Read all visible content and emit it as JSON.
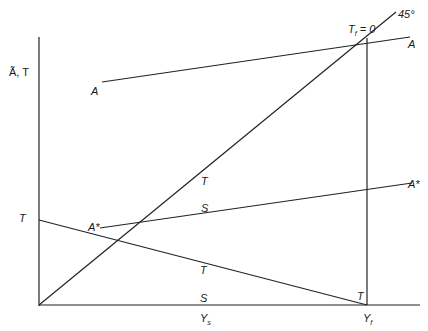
{
  "diagram": {
    "y_axis_label": "Ã,  T",
    "x_axis_tick_labels": [
      {
        "main": "Y",
        "sub": "s"
      },
      {
        "main": "Y",
        "sub": "f"
      }
    ],
    "degree_label": "45°",
    "tf_label": {
      "main": "T",
      "sub": "f",
      "rest": " = 0"
    },
    "curves": {
      "A_left": "A",
      "A_right": "A",
      "Astar_left": "A*",
      "Astar_right": "A*",
      "T_left": "T"
    },
    "segment_labels": {
      "T_upper": "T",
      "S_upper": "S",
      "T_lower": "T",
      "S_lower": "S",
      "T_corner": "T"
    }
  }
}
